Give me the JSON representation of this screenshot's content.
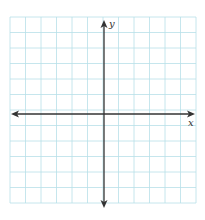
{
  "diagram": {
    "type": "coordinate-plane",
    "grid": {
      "columns": 12,
      "rows": 12,
      "left": 10,
      "top": 17,
      "cell_size": 15.5,
      "line_color": "#b8e0e8"
    },
    "axes": {
      "color": "#333333",
      "x_axis": {
        "label": "x",
        "y_position": 114,
        "x_start": 11,
        "x_end": 195
      },
      "y_axis": {
        "label": "y",
        "x_position": 104,
        "y_start": 20,
        "y_end": 208
      }
    }
  }
}
